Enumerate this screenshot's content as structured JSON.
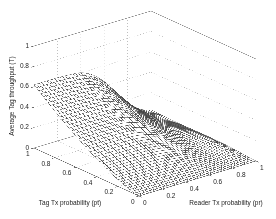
{
  "figure": {
    "background": "#ffffff",
    "text_color": "#222222"
  },
  "chart_data": {
    "type": "surface",
    "title": "",
    "xlabel": "Reader Tx probability (pr)",
    "ylabel": "Tag Tx probability (pt)",
    "zlabel": "Average Tag throughput (T)",
    "x_ticks": [
      "0",
      "0.2",
      "0.4",
      "0.6",
      "0.8",
      "1"
    ],
    "y_ticks": [
      "1",
      "0.8",
      "0.6",
      "0.4",
      "0.2",
      "0"
    ],
    "z_ticks": [
      "0",
      "0.2",
      "0.4",
      "0.6",
      "0.8",
      "1"
    ],
    "x_tick_vals": [
      0,
      0.2,
      0.4,
      0.6,
      0.8,
      1
    ],
    "y_tick_vals": [
      1,
      0.8,
      0.6,
      0.4,
      0.2,
      0
    ],
    "z_tick_vals": [
      0,
      0.2,
      0.4,
      0.6,
      0.8,
      1
    ],
    "x_range": [
      0,
      1
    ],
    "y_range": [
      0,
      1
    ],
    "z_range": [
      0,
      1
    ],
    "grid": true,
    "style": {
      "mesh_line_color": "#3c3c3c",
      "mesh_face_color": "#ffffff",
      "grid_dot_color": "#bdbdbd",
      "box_edge_color": "#8c8c8c",
      "axis_edge_color": "#666666",
      "mesh_divisions": 45
    },
    "surface_model": {
      "description": "T(pt,pr) = z_max * pt^pt_exponent * g(pr) + bump near pr=0.92",
      "z_max": 0.62,
      "pt_exponent": 1.4,
      "pr_points": [
        0,
        0.1,
        0.2,
        0.3,
        0.4,
        0.5,
        0.6,
        0.7,
        0.8,
        0.9,
        1
      ],
      "pr_gain": [
        1.0,
        1.0,
        1.0,
        0.99,
        0.97,
        0.88,
        0.72,
        0.5,
        0.28,
        0.12,
        0.05
      ],
      "bump": {
        "amplitude": 0.05,
        "pr_center": 0.92,
        "pr_sigma": 0.08,
        "pt_center": 0.35,
        "pt_sigma": 0.3
      }
    },
    "sampled_grid": {
      "pt": [
        0,
        0.2,
        0.4,
        0.6,
        0.8,
        1
      ],
      "pr": [
        0,
        0.2,
        0.4,
        0.6,
        0.8,
        1
      ],
      "T": [
        [
          0.0,
          0.0,
          0.0,
          0.0,
          0.001,
          0.005
        ],
        [
          0.065,
          0.065,
          0.063,
          0.047,
          0.022,
          0.017
        ],
        [
          0.172,
          0.172,
          0.167,
          0.124,
          0.053,
          0.027
        ],
        [
          0.303,
          0.303,
          0.294,
          0.218,
          0.088,
          0.024
        ],
        [
          0.454,
          0.454,
          0.44,
          0.327,
          0.128,
          0.025
        ],
        [
          0.62,
          0.62,
          0.601,
          0.446,
          0.174,
          0.031
        ]
      ]
    }
  }
}
